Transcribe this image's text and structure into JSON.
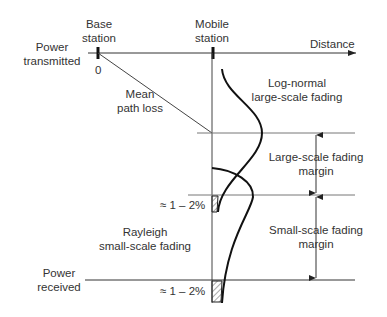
{
  "labels": {
    "base_station": [
      "Base",
      "station"
    ],
    "mobile_station": [
      "Mobile",
      "station"
    ],
    "distance": "Distance",
    "power_transmitted": [
      "Power",
      "transmitted"
    ],
    "zero": "0",
    "mean_path_loss": [
      "Mean",
      "path loss"
    ],
    "log_normal": [
      "Log-normal",
      "large-scale fading"
    ],
    "large_scale_margin": [
      "Large-scale fading",
      "margin"
    ],
    "small_scale_margin": [
      "Small-scale fading",
      "margin"
    ],
    "rayleigh": [
      "Rayleigh",
      "small-scale fading"
    ],
    "power_received": [
      "Power",
      "received"
    ],
    "outage_upper": "≈ 1 – 2%",
    "outage_lower": "≈ 1 – 2%"
  },
  "colors": {
    "line": "#1a1a1a",
    "thin_line": "#666666",
    "text": "#333333"
  }
}
